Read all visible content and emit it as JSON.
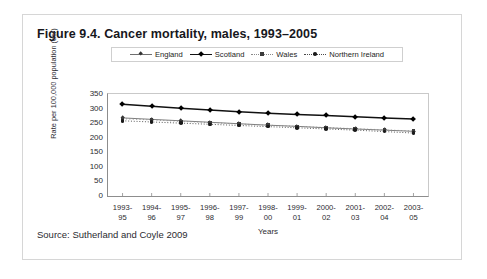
{
  "figure": {
    "title": "Figure 9.4. Cancer mortality, males, 1993–2005",
    "source": "Source: Sutherland and Coyle 2009"
  },
  "chart_data": {
    "type": "line",
    "title": "Figure 9.4. Cancer mortality, males, 1993–2005",
    "xlabel": "Years",
    "ylabel": "Rate per 100,000 population (dsr)",
    "ylim": [
      0,
      350
    ],
    "yticks": [
      0,
      50,
      100,
      150,
      200,
      250,
      300,
      350
    ],
    "grid": false,
    "legend_position": "top",
    "categories": [
      "1993-95",
      "1994-96",
      "1995-97",
      "1996-98",
      "1997-99",
      "1998-00",
      "1999-01",
      "2000-02",
      "2001-03",
      "2002-04",
      "2003-05"
    ],
    "category_lines": [
      [
        "1993-",
        "95"
      ],
      [
        "1994-",
        "96"
      ],
      [
        "1995-",
        "97"
      ],
      [
        "1996-",
        "98"
      ],
      [
        "1997-",
        "99"
      ],
      [
        "1998-",
        "00"
      ],
      [
        "1999-",
        "01"
      ],
      [
        "2000-",
        "02"
      ],
      [
        "2001-",
        "03"
      ],
      [
        "2002-",
        "04"
      ],
      [
        "2003-",
        "05"
      ]
    ],
    "series": [
      {
        "name": "England",
        "marker": "diamond-thin",
        "line_style": "solid-thin",
        "color": "#6f6f6f",
        "values": [
          268,
          263,
          258,
          253,
          248,
          243,
          239,
          234,
          230,
          226,
          222
        ]
      },
      {
        "name": "Scotland",
        "marker": "diamond-bold",
        "line_style": "solid-bold",
        "color": "#111111",
        "values": [
          315,
          308,
          301,
          295,
          289,
          284,
          280,
          276,
          272,
          268,
          264
        ]
      },
      {
        "name": "Wales",
        "marker": "square",
        "line_style": "dotted-sparse",
        "color": "#8a8a8a",
        "values": [
          265,
          261,
          256,
          252,
          247,
          243,
          239,
          235,
          231,
          227,
          223
        ]
      },
      {
        "name": "Northern Ireland",
        "marker": "dot",
        "line_style": "dotted",
        "color": "#4a4a4a",
        "values": [
          258,
          254,
          250,
          246,
          242,
          238,
          234,
          230,
          226,
          221,
          216
        ]
      }
    ]
  }
}
